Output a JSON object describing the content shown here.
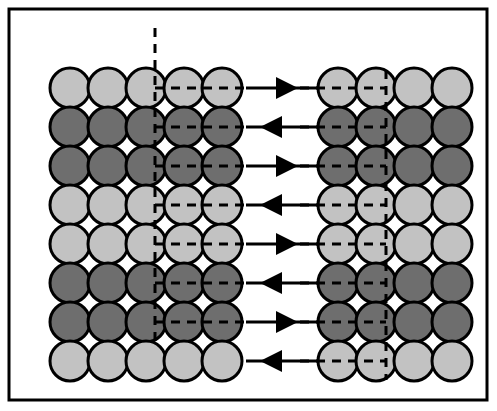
{
  "figure": {
    "name": "dislocation-diffusion-schematic",
    "canvas": {
      "width": 497,
      "height": 411,
      "background": "#ffffff"
    },
    "frame": {
      "name": "figure-border",
      "x": 9,
      "y": 9,
      "width": 478,
      "height": 391,
      "stroke": "#000000",
      "stroke_width": 3,
      "fill": "#ffffff"
    },
    "colors": {
      "light_circle": "#c2c2c2",
      "dark_circle": "#6e6e6e",
      "outline": "#000000",
      "dash": "#000000",
      "arrow": "#000000",
      "background": "#ffffff"
    },
    "circle": {
      "diameter": 40,
      "radius": 20,
      "outline_width": 3
    },
    "row_shading": [
      "light",
      "dark",
      "dark",
      "light",
      "light",
      "dark",
      "dark",
      "light"
    ],
    "row_count": 8,
    "row_y_centers": [
      88,
      127,
      166,
      205,
      244,
      283,
      322,
      361
    ],
    "left_grid": {
      "name": "left-lattice-grid",
      "columns": 5,
      "rows": 8,
      "col_x_centers": [
        70,
        108,
        146,
        184,
        222
      ],
      "rows_data": [
        {
          "index": 0,
          "shade": "light",
          "cells": [
            "light",
            "light",
            "light",
            "light",
            "light"
          ]
        },
        {
          "index": 1,
          "shade": "dark",
          "cells": [
            "dark",
            "dark",
            "dark",
            "dark",
            "dark"
          ]
        },
        {
          "index": 2,
          "shade": "dark",
          "cells": [
            "dark",
            "dark",
            "dark",
            "dark",
            "dark"
          ]
        },
        {
          "index": 3,
          "shade": "light",
          "cells": [
            "light",
            "light",
            "light",
            "light",
            "light"
          ]
        },
        {
          "index": 4,
          "shade": "light",
          "cells": [
            "light",
            "light",
            "light",
            "light",
            "light"
          ]
        },
        {
          "index": 5,
          "shade": "dark",
          "cells": [
            "dark",
            "dark",
            "dark",
            "dark",
            "dark"
          ]
        },
        {
          "index": 6,
          "shade": "dark",
          "cells": [
            "dark",
            "dark",
            "dark",
            "dark",
            "dark"
          ]
        },
        {
          "index": 7,
          "shade": "light",
          "cells": [
            "light",
            "light",
            "light",
            "light",
            "light"
          ]
        }
      ]
    },
    "right_grid": {
      "name": "right-lattice-grid",
      "columns": 4,
      "rows": 8,
      "col_x_centers": [
        338,
        376,
        414,
        452
      ],
      "rows_data": [
        {
          "index": 0,
          "shade": "light",
          "cells": [
            "light",
            "light",
            "light",
            "light"
          ]
        },
        {
          "index": 1,
          "shade": "dark",
          "cells": [
            "dark",
            "dark",
            "dark",
            "dark"
          ]
        },
        {
          "index": 2,
          "shade": "dark",
          "cells": [
            "dark",
            "dark",
            "dark",
            "dark"
          ]
        },
        {
          "index": 3,
          "shade": "light",
          "cells": [
            "light",
            "light",
            "light",
            "light"
          ]
        },
        {
          "index": 4,
          "shade": "light",
          "cells": [
            "light",
            "light",
            "light",
            "light"
          ]
        },
        {
          "index": 5,
          "shade": "dark",
          "cells": [
            "dark",
            "dark",
            "dark",
            "dark"
          ]
        },
        {
          "index": 6,
          "shade": "dark",
          "cells": [
            "dark",
            "dark",
            "dark",
            "dark"
          ]
        },
        {
          "index": 7,
          "shade": "light",
          "cells": [
            "light",
            "light",
            "light",
            "light"
          ]
        }
      ]
    },
    "left_dash_overlay": {
      "name": "left-dashed-boundary",
      "vertical_line": {
        "x": 155,
        "y_top": 28,
        "y_bottom": 341
      },
      "horizontal_rows": [
        0,
        1,
        2,
        3,
        4,
        5,
        6
      ],
      "h_x_start": 155,
      "h_x_end": 246,
      "dash_pattern": "9,7",
      "stroke_width": 3
    },
    "right_dash_overlay": {
      "name": "right-dashed-boundary",
      "vertical_line": {
        "x": 386,
        "y_top": 70,
        "y_bottom": 380
      },
      "horizontal_rows": [
        0,
        1,
        2,
        3,
        4,
        5,
        6,
        7
      ],
      "h_x_start": 300,
      "h_x_end": 386,
      "dash_pattern": "9,7",
      "stroke_width": 3
    },
    "arrows": {
      "name": "transport-arrows",
      "count": 8,
      "x_start": 246,
      "x_end": 318,
      "head_length": 22,
      "head_half_width": 11,
      "shaft_width": 3,
      "items": [
        {
          "index": 0,
          "row": 0,
          "direction": "right",
          "y": 88,
          "label": "arrow-row-1-right"
        },
        {
          "index": 1,
          "row": 1,
          "direction": "left",
          "y": 127,
          "label": "arrow-row-2-left"
        },
        {
          "index": 2,
          "row": 2,
          "direction": "right",
          "y": 166,
          "label": "arrow-row-3-right"
        },
        {
          "index": 3,
          "row": 3,
          "direction": "left",
          "y": 205,
          "label": "arrow-row-4-left"
        },
        {
          "index": 4,
          "row": 4,
          "direction": "right",
          "y": 244,
          "label": "arrow-row-5-right"
        },
        {
          "index": 5,
          "row": 5,
          "direction": "left",
          "y": 283,
          "label": "arrow-row-6-left"
        },
        {
          "index": 6,
          "row": 6,
          "direction": "right",
          "y": 322,
          "label": "arrow-row-7-right"
        },
        {
          "index": 7,
          "row": 7,
          "direction": "left",
          "y": 361,
          "label": "arrow-row-8-left"
        }
      ]
    },
    "caption_sliver": {
      "name": "cropped-caption-text",
      "text": "",
      "visible": false
    }
  }
}
